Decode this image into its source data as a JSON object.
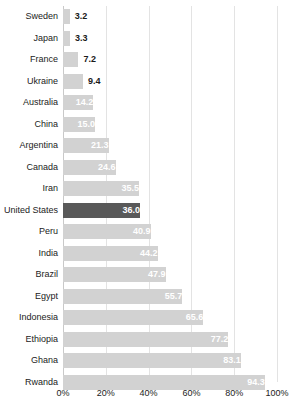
{
  "chart_data": {
    "type": "bar",
    "orientation": "horizontal",
    "title": "",
    "subtitle": "",
    "xlabel": "",
    "ylabel": "",
    "xlim": [
      0,
      100
    ],
    "grid": true,
    "legend": false,
    "value_suffix": "%",
    "xticks": [
      "0%",
      "20%",
      "40%",
      "60%",
      "80%",
      "100%"
    ],
    "xtick_values": [
      0,
      20,
      40,
      60,
      80,
      100
    ],
    "categories": [
      "Sweden",
      "Japan",
      "France",
      "Ukraine",
      "Australia",
      "China",
      "Argentina",
      "Canada",
      "Iran",
      "United States",
      "Peru",
      "India",
      "Brazil",
      "Egypt",
      "Indonesia",
      "Ethiopia",
      "Ghana",
      "Rwanda"
    ],
    "values": [
      3.2,
      3.3,
      7.2,
      9.4,
      14.2,
      15.0,
      21.3,
      24.6,
      35.5,
      36.0,
      40.9,
      44.2,
      47.9,
      55.7,
      65.6,
      77.2,
      83.1,
      94.3
    ],
    "value_labels": [
      "3.2",
      "3.3",
      "7.2",
      "9.4",
      "14.2",
      "15.0",
      "21.3",
      "24.6",
      "35.5",
      "36.0",
      "40.9",
      "44.2",
      "47.9",
      "55.7",
      "65.6",
      "77.2",
      "83.1",
      "94.3"
    ],
    "highlight_category": "United States",
    "colors": {
      "bar": "#d2d2d2",
      "bar_highlight": "#595959",
      "label_inside": "#ffffff",
      "label_outside": "#1a1a1a",
      "gridline": "#e3e3e3",
      "axis": "#c9c9c9",
      "background": "#ffffff",
      "text": "#222222"
    }
  }
}
